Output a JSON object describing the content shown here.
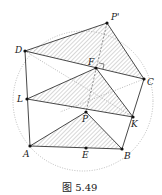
{
  "figure": {
    "caption": "图 5.49",
    "circle": {
      "cx": 83,
      "cy": 101,
      "r": 70
    },
    "points": {
      "P'": {
        "x": 107,
        "y": 23,
        "label": "P'",
        "lx": 111,
        "ly": 20
      },
      "D": {
        "x": 25,
        "y": 51,
        "label": "D",
        "lx": 15,
        "ly": 53
      },
      "F": {
        "x": 96,
        "y": 68,
        "label": "F",
        "lx": 88,
        "ly": 65
      },
      "C": {
        "x": 144,
        "y": 79,
        "label": "C",
        "lx": 147,
        "ly": 85
      },
      "L": {
        "x": 27,
        "y": 99,
        "label": "L",
        "lx": 17,
        "ly": 102
      },
      "K": {
        "x": 133,
        "y": 117,
        "label": "K",
        "lx": 131,
        "ly": 127
      },
      "P": {
        "x": 86,
        "y": 112,
        "label": "P",
        "lx": 82,
        "ly": 122
      },
      "A": {
        "x": 30,
        "y": 146,
        "label": "A",
        "lx": 23,
        "ly": 157
      },
      "E": {
        "x": 86,
        "y": 148,
        "label": "E",
        "lx": 82,
        "ly": 158
      },
      "B": {
        "x": 122,
        "y": 149,
        "label": "B",
        "lx": 124,
        "ly": 159
      }
    }
  }
}
